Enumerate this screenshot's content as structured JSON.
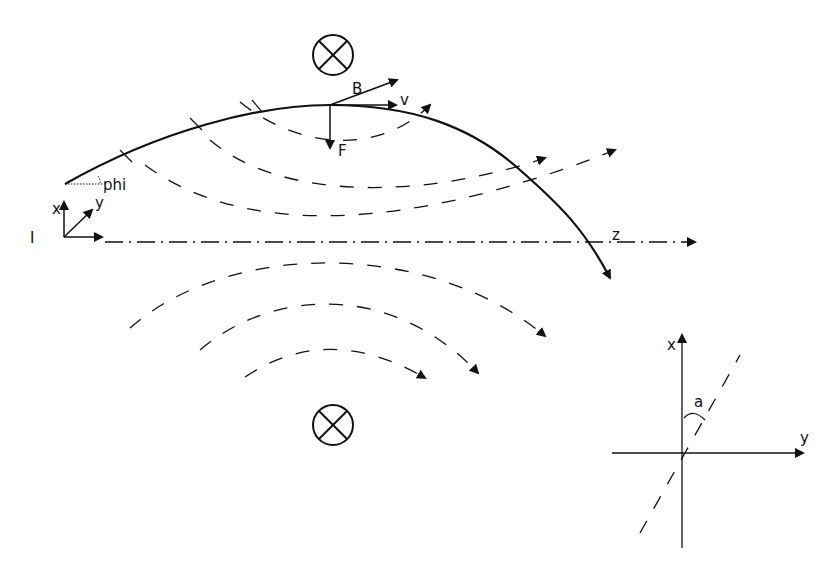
{
  "diagram": {
    "labels": {
      "phi": "phi",
      "origin": "I",
      "axis_x": "x",
      "axis_y": "y",
      "axis_z": "z",
      "field": "B",
      "velocity": "v",
      "force": "F",
      "inset_x": "x",
      "inset_y": "y",
      "inset_angle": "a"
    },
    "symbols": {
      "field_into_page_top": "magnetic-field-into-page",
      "field_into_page_bottom": "magnetic-field-into-page"
    },
    "colors": {
      "ink": "#111111",
      "background": "#ffffff"
    }
  }
}
